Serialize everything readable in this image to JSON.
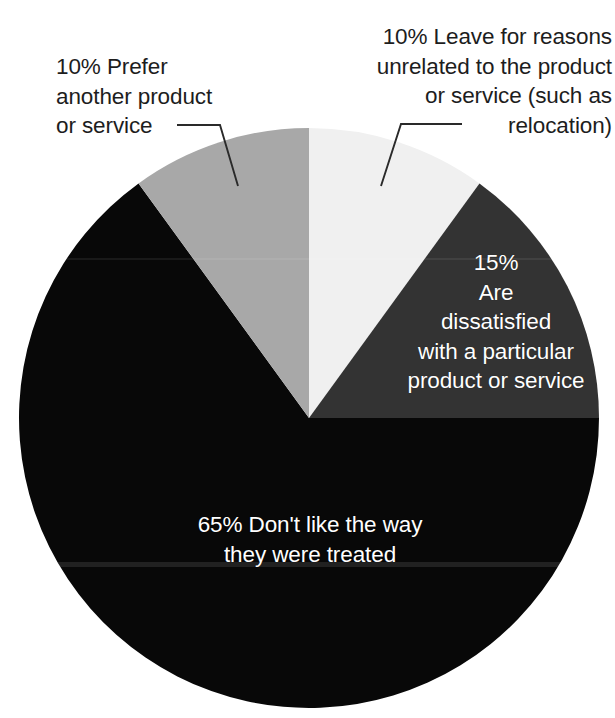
{
  "chart_data": {
    "type": "pie",
    "title": "",
    "subtitle": "",
    "xlabel": "",
    "ylabel": "",
    "legend_position": "none",
    "grid": false,
    "units": "percent",
    "start_angle_deg": 0,
    "direction": "clockwise",
    "center": {
      "x": 309,
      "y": 418
    },
    "radius": 290,
    "categories": [
      "Leave for reasons unrelated to the product or service (such as relocation)",
      "Are dissatisfied with a particular product or service",
      "Don't like the way they were treated",
      "Prefer another product or service"
    ],
    "values": [
      10,
      15,
      65,
      10
    ],
    "slices": [
      {
        "id": "unrelated",
        "percent_text": "10%",
        "value": 10,
        "label": "Leave for reasons unrelated to the product or service (such as relocation)",
        "color": "#f0f0f0",
        "start_deg": 0,
        "end_deg": 36,
        "label_placement": "external",
        "label_color": "#1d1d1d"
      },
      {
        "id": "dissatisfied",
        "percent_text": "15%",
        "value": 15,
        "label": "Are dissatisfied with a particular product or service",
        "color": "#333333",
        "start_deg": 36,
        "end_deg": 90,
        "label_placement": "internal",
        "label_color": "#ffffff"
      },
      {
        "id": "treated",
        "percent_text": "65%",
        "value": 65,
        "label": "Don't like the way they were treated",
        "color": "#080808",
        "start_deg": 90,
        "end_deg": 324,
        "label_placement": "internal",
        "label_color": "#ffffff"
      },
      {
        "id": "prefer",
        "percent_text": "10%",
        "value": 10,
        "label": "Prefer another product or service",
        "color": "#a8a8a8",
        "start_deg": 324,
        "end_deg": 360,
        "label_placement": "external",
        "label_color": "#1d1d1d"
      }
    ]
  },
  "callouts": {
    "prefer": {
      "text": "10% Prefer\nanother product\nor service"
    },
    "unrelated": {
      "text": "10% Leave for reasons\nunrelated to the product\nor service (such as\nrelocation)"
    }
  },
  "slice_labels": {
    "dissatisfied": {
      "text": "15%\nAre\ndissatisfied\nwith a particular\nproduct or service"
    },
    "treated": {
      "text": "65% Don't like the way\nthey were treated"
    }
  },
  "colors": {
    "background": "#ffffff",
    "slice_light": "#f0f0f0",
    "slice_medium_gray": "#a8a8a8",
    "slice_dark_gray": "#333333",
    "slice_black": "#080808",
    "leader_line": "#2a2a2a",
    "text_dark": "#1d1d1d",
    "text_light": "#ffffff"
  }
}
